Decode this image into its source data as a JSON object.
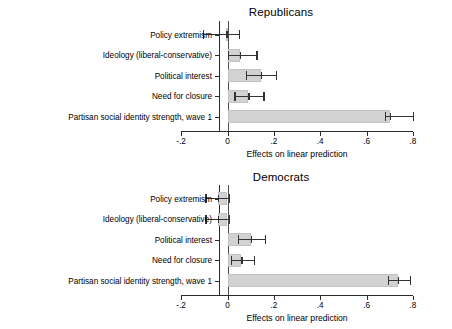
{
  "chart_data": [
    {
      "type": "bar",
      "orientation": "horizontal",
      "title": "Republicans",
      "xlabel": "Effects on linear prediction",
      "ylabel": "",
      "xlim": [
        -0.2,
        0.8
      ],
      "xticks": [
        -0.2,
        0.0,
        0.2,
        0.4,
        0.6,
        0.8
      ],
      "xtick_labels": [
        "-.2",
        "0",
        ".2",
        ".4",
        ".6",
        ".8"
      ],
      "grid": false,
      "legend": "none",
      "categories": [
        "Policy extremism",
        "Ideology (liberal-conservative)",
        "Political interest",
        "Need for closure",
        "Partisan social identity strength, wave 1"
      ],
      "values": [
        -0.005,
        0.055,
        0.145,
        0.09,
        0.7
      ],
      "ci_low": [
        -0.105,
        0.0,
        0.08,
        0.03,
        0.68
      ],
      "ci_high": [
        0.05,
        0.125,
        0.21,
        0.155,
        0.8
      ],
      "bar_color": "#d2d2d2",
      "error_color": "#333333"
    },
    {
      "type": "bar",
      "orientation": "horizontal",
      "title": "Democrats",
      "xlabel": "Effects on linear prediction",
      "ylabel": "",
      "xlim": [
        -0.2,
        0.8
      ],
      "xticks": [
        -0.2,
        0.0,
        0.2,
        0.4,
        0.6,
        0.8
      ],
      "xtick_labels": [
        "-.2",
        "0",
        ".2",
        ".4",
        ".6",
        ".8"
      ],
      "grid": false,
      "legend": "none",
      "categories": [
        "Policy extremism",
        "Ideology (liberal-conservative)",
        "Political interest",
        "Need for closure",
        "Partisan social identity strength, wave 1"
      ],
      "values": [
        -0.04,
        -0.04,
        0.1,
        0.06,
        0.735
      ],
      "ci_low": [
        -0.095,
        -0.095,
        0.045,
        0.015,
        0.69
      ],
      "ci_high": [
        0.005,
        0.005,
        0.16,
        0.115,
        0.785
      ],
      "bar_color": "#d2d2d2",
      "error_color": "#333333"
    }
  ],
  "panels": {
    "top": {
      "title": "Republicans",
      "axis_title": "Effects on linear prediction",
      "tick_labels": [
        "-.2",
        "0",
        ".2",
        ".4",
        ".6",
        ".8"
      ],
      "categories": [
        "Policy extremism",
        "Ideology (liberal-conservative)",
        "Political interest",
        "Need for closure",
        "Partisan social identity strength, wave 1"
      ]
    },
    "bottom": {
      "title": "Democrats",
      "axis_title": "Effects on linear prediction",
      "tick_labels": [
        "-.2",
        "0",
        ".2",
        ".4",
        ".6",
        ".8"
      ],
      "categories": [
        "Policy extremism",
        "Ideology (liberal-conservative)",
        "Political interest",
        "Need for closure",
        "Partisan social identity strength, wave 1"
      ]
    }
  }
}
